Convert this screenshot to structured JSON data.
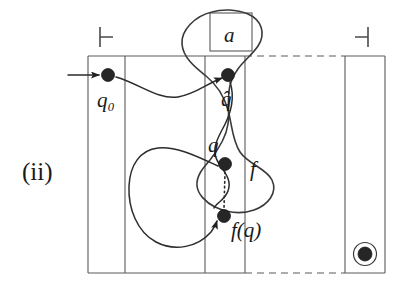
{
  "figure": {
    "caption_label": "(ii)",
    "background_color": "#ffffff",
    "ink_color": "#2b2b2b",
    "tape_color": "#5a5a5a"
  },
  "labels": {
    "q0": "q₀",
    "q_hat": "q̂",
    "q": "q",
    "fq": "f(q)",
    "f": "f",
    "a": "a"
  },
  "markers": {
    "left_endmarker": "⊢",
    "right_endmarker": "⊣"
  },
  "nodes": [
    {
      "name": "q0",
      "label": "q₀",
      "cx": 108,
      "cy": 75,
      "r": 6.5,
      "label_x": 100,
      "label_y": 104
    },
    {
      "name": "q-hat",
      "label": "q̂",
      "cx": 228,
      "cy": 75,
      "r": 6.5,
      "label_x": 222,
      "label_y": 104
    },
    {
      "name": "q",
      "label": "q",
      "cx": 225,
      "cy": 164,
      "r": 6.5,
      "label_x": 211,
      "label_y": 150
    },
    {
      "name": "f-of-q",
      "label": "f(q)",
      "cx": 224,
      "cy": 216,
      "r": 6.5,
      "label_x": 232,
      "label_y": 234
    }
  ],
  "tape": {
    "top_y": 56,
    "bottom_y": 273,
    "solid_span_x": [
      88,
      245
    ],
    "dashed_span_x": [
      245,
      345
    ],
    "cells": [
      {
        "name": "cell-q0",
        "x": 88,
        "width": 37
      },
      {
        "name": "cell-middle-wide",
        "x": 125,
        "width": 80
      },
      {
        "name": "cell-q",
        "x": 205,
        "width": 40
      },
      {
        "name": "cell-accept",
        "x": 345,
        "width": 40
      }
    ],
    "endmarker_left": {
      "x": 100,
      "y": 37
    },
    "endmarker_right": {
      "x": 362,
      "y": 37
    }
  },
  "symbol_box": {
    "name": "a-box",
    "label": "a",
    "x": 210,
    "y": 13,
    "width": 42,
    "height": 38
  },
  "accept_state": {
    "name": "accepting-state",
    "cx": 365,
    "cy": 254,
    "inner_r": 7,
    "outer_r": 11.5
  },
  "f_label": {
    "text": "f",
    "x": 252,
    "y": 170
  }
}
